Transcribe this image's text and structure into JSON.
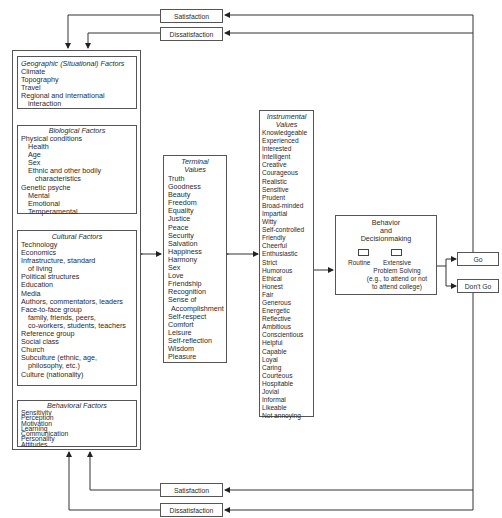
{
  "feedback_top": {
    "satisfaction": "Satisfaction",
    "dissatisfaction": "Dissatisfaction"
  },
  "feedback_bottom": {
    "satisfaction": "Satisfaction",
    "dissatisfaction": "Dissatisfaction"
  },
  "factors": {
    "geographic": {
      "title": "Geographic (Situational) Factors",
      "items": [
        {
          "text": "Climate",
          "indent": 0
        },
        {
          "text": "Topography",
          "indent": 0
        },
        {
          "text": "Travel",
          "indent": 0
        },
        {
          "text": "Regional and international",
          "indent": 0
        },
        {
          "text": "interaction",
          "indent": 1
        }
      ]
    },
    "biological": {
      "title": "Biological Factors",
      "items": [
        {
          "text": "Physical conditions",
          "indent": 0
        },
        {
          "text": "Health",
          "indent": 1
        },
        {
          "text": "Age",
          "indent": 1
        },
        {
          "text": "Sex",
          "indent": 1
        },
        {
          "text": "Ethnic and other bodily",
          "indent": 1
        },
        {
          "text": "characteristics",
          "indent": 2
        },
        {
          "text": "Genetic psyche",
          "indent": 0
        },
        {
          "text": "Mental",
          "indent": 1
        },
        {
          "text": "Emotional",
          "indent": 1
        },
        {
          "text": "Temperamental",
          "indent": 1
        }
      ]
    },
    "cultural": {
      "title": "Cultural Factors",
      "items": [
        {
          "text": "Technology",
          "indent": 0
        },
        {
          "text": "Economics",
          "indent": 0
        },
        {
          "text": "Infrastructure, standard",
          "indent": 0
        },
        {
          "text": "of living",
          "indent": 1
        },
        {
          "text": "Political structures",
          "indent": 0
        },
        {
          "text": "Education",
          "indent": 0
        },
        {
          "text": "Media",
          "indent": 0
        },
        {
          "text": "Authors, commentators, leaders",
          "indent": 0
        },
        {
          "text": "Face-to-face group",
          "indent": 0
        },
        {
          "text": "family, friends, peers,",
          "indent": 1
        },
        {
          "text": "co-workers, students, teachers",
          "indent": 1
        },
        {
          "text": "Reference group",
          "indent": 0
        },
        {
          "text": "Social class",
          "indent": 0
        },
        {
          "text": "Church",
          "indent": 0
        },
        {
          "text": "Subculture (ethnic, age,",
          "indent": 0
        },
        {
          "text": "philosophy, etc.)",
          "indent": 1
        },
        {
          "text": "Culture (nationality)",
          "indent": 0
        }
      ]
    },
    "behavioral": {
      "title": "Behavioral Factors",
      "items": [
        {
          "text": "Sensitivity",
          "indent": 0
        },
        {
          "text": "Perception",
          "indent": 0
        },
        {
          "text": "Motivation",
          "indent": 0
        },
        {
          "text": "Learning",
          "indent": 0
        },
        {
          "text": "Communication",
          "indent": 0
        },
        {
          "text": "Personality",
          "indent": 0
        },
        {
          "text": "Attitudes",
          "indent": 0
        }
      ]
    }
  },
  "terminal_values": {
    "title_line1": "Terminal",
    "title_line2": "Values",
    "items": [
      "Truth",
      "Goodness",
      "Beauty",
      "Freedom",
      "Equality",
      "Justice",
      "Peace",
      "Security",
      "Salvation",
      "Happiness",
      "Harmony",
      "Sex",
      "Love",
      "Friendship",
      "Recognition",
      "Sense of",
      "Accomplishment",
      "Self-respect",
      "Comfort",
      "Leisure",
      "Self-reflection",
      "Wisdom",
      "Pleasure"
    ]
  },
  "instrumental_values": {
    "title_line1": "Instrumental",
    "title_line2": "Values",
    "items": [
      "Knowledgeable",
      "Experienced",
      "Interested",
      "Intelligent",
      "Creative",
      "Courageous",
      "Realistic",
      "Sensitive",
      "Prudent",
      "Broad-minded",
      "Impartial",
      "Witty",
      "Self-controlled",
      "Friendly",
      "Cheerful",
      "Enthusiastic",
      "Strict",
      "Humorous",
      "Ethical",
      "Honest",
      "Fair",
      "Generous",
      "Energetic",
      "Reflective",
      "Ambitious",
      "Conscientious",
      "Helpful",
      "Capable",
      "Loyal",
      "Caring",
      "Courteous",
      "Hospitable",
      "Jovial",
      "Informal",
      "Likeable",
      "Not annoying"
    ]
  },
  "decision": {
    "title_line1": "Behavior",
    "title_line2": "and",
    "title_line3": "Decisionmaking",
    "routine": "Routine",
    "extensive_line1": "Extensive",
    "extensive_line2": "Problem Solving",
    "extensive_line3": "(e.g., to attend or not",
    "extensive_line4": "to attend college)"
  },
  "outcomes": {
    "go": "Go",
    "dont_go": "Don't Go"
  }
}
